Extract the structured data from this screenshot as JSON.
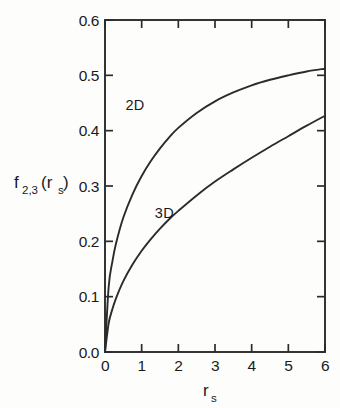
{
  "chart_data": {
    "type": "line",
    "title": "",
    "xlabel": "r_s",
    "ylabel": "f_2,3(r_s)",
    "xlim": [
      0,
      6
    ],
    "ylim": [
      0.0,
      0.6
    ],
    "grid": false,
    "legend": "inline-curve-labels",
    "xticks": [
      "0",
      "1",
      "2",
      "3",
      "4",
      "5",
      "6"
    ],
    "xtick_values": [
      0,
      1,
      2,
      3,
      4,
      5,
      6
    ],
    "yticks": [
      "0.0",
      "0.1",
      "0.2",
      "0.3",
      "0.4",
      "0.5",
      "0.6"
    ],
    "ytick_values": [
      0.0,
      0.1,
      0.2,
      0.3,
      0.4,
      0.5,
      0.6
    ],
    "x": [
      0,
      0.1,
      0.2,
      0.3,
      0.5,
      0.75,
      1.0,
      1.25,
      1.5,
      1.75,
      2.0,
      2.5,
      3.0,
      3.5,
      4.0,
      4.5,
      5.0,
      5.5,
      6.0
    ],
    "series": [
      {
        "name": "2D",
        "label": "2D",
        "color": "#2b2b2b",
        "values": [
          0.0,
          0.118,
          0.163,
          0.196,
          0.243,
          0.285,
          0.318,
          0.345,
          0.368,
          0.388,
          0.405,
          0.432,
          0.453,
          0.469,
          0.482,
          0.492,
          0.5,
          0.507,
          0.512
        ]
      },
      {
        "name": "3D",
        "label": "3D",
        "color": "#2b2b2b",
        "values": [
          0.0,
          0.052,
          0.077,
          0.097,
          0.128,
          0.158,
          0.183,
          0.204,
          0.223,
          0.24,
          0.255,
          0.283,
          0.308,
          0.33,
          0.351,
          0.371,
          0.39,
          0.409,
          0.427
        ]
      }
    ],
    "annotations": [
      {
        "text": "2D",
        "x": 0.82,
        "y": 0.437
      },
      {
        "text": "3D",
        "x": 1.62,
        "y": 0.242
      }
    ]
  },
  "axis_labels": {
    "y_base": "f",
    "y_sub1": "2,3",
    "y_paren_open": "(r",
    "y_sub2": "s",
    "y_paren_close": ")",
    "x_base": "r",
    "x_sub": "s"
  },
  "ticklabels": {
    "y": [
      "0.6",
      "0.5",
      "0.4",
      "0.3",
      "0.2",
      "0.1",
      "0.0"
    ],
    "x": [
      "0",
      "1",
      "2",
      "3",
      "4",
      "5",
      "6"
    ]
  },
  "curve_labels": {
    "two_d": "2D",
    "three_d": "3D"
  },
  "colors": {
    "ink": "#2b2b2b",
    "background": "#fdfdfc"
  }
}
